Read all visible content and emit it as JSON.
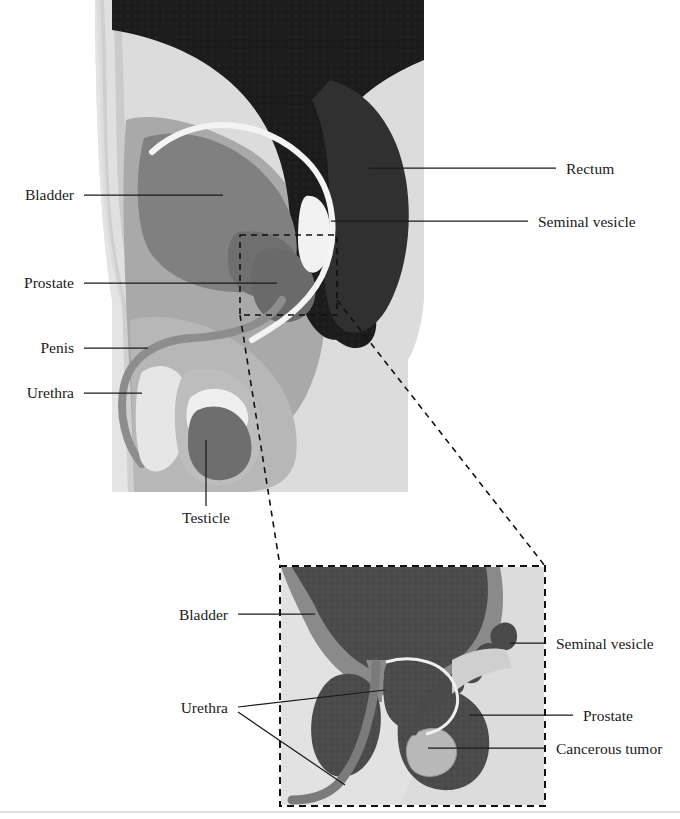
{
  "figure": {
    "main_view_name": "sagittal-male-pelvis",
    "inset_view_name": "prostate-detail-inset"
  },
  "colors": {
    "background": "#ffffff",
    "body_light": "#dcdcdc",
    "body_mid": "#a9a9a9",
    "body_skin": "#c8c8c8",
    "organ_gray": "#808080",
    "organ_dark": "#5e5e5e",
    "rectum_black": "#1c1c1c",
    "highlight_white": "#f2f2f2",
    "tumor_light": "#b5b5b5",
    "leader_line": "#1a1a1a",
    "text": "#1a1a1a",
    "dashed_frame": "#111111",
    "baseline_rule": "#b9b9b9"
  },
  "main_diagram": {
    "labels_left": [
      {
        "id": "bladder",
        "text": "Bladder",
        "x": 74,
        "y": 200,
        "line_x1": 84,
        "line_y1": 195,
        "line_x2": 223,
        "line_y2": 195
      },
      {
        "id": "prostate",
        "text": "Prostate",
        "x": 74,
        "y": 288,
        "line_x1": 84,
        "line_y1": 283,
        "line_x2": 277,
        "line_y2": 283
      },
      {
        "id": "penis",
        "text": "Penis",
        "x": 74,
        "y": 353,
        "line_x1": 84,
        "line_y1": 348,
        "line_x2": 148,
        "line_y2": 348
      },
      {
        "id": "urethra",
        "text": "Urethra",
        "x": 74,
        "y": 398,
        "line_x1": 84,
        "line_y1": 393,
        "line_x2": 142,
        "line_y2": 393
      }
    ],
    "labels_right": [
      {
        "id": "rectum",
        "text": "Rectum",
        "x": 566,
        "y": 174,
        "line_x1": 556,
        "line_y1": 168,
        "line_x2": 369,
        "line_y2": 168
      },
      {
        "id": "seminal-vesicle",
        "text": "Seminal vesicle",
        "x": 538,
        "y": 227,
        "line_x1": 528,
        "line_y1": 221,
        "line_x2": 331,
        "line_y2": 221
      }
    ],
    "labels_bottom": [
      {
        "id": "testicle",
        "text": "Testicle",
        "x": 206,
        "y": 523,
        "line_x1": 206,
        "line_y1": 506,
        "line_x2": 206,
        "line_y2": 440
      }
    ],
    "callout_box": {
      "x": 240,
      "y": 235,
      "width": 97,
      "height": 80
    }
  },
  "inset_diagram": {
    "frame": {
      "x": 280,
      "y": 566,
      "width": 265,
      "height": 240
    },
    "labels_left": [
      {
        "id": "bladder-inset",
        "text": "Bladder",
        "x": 228,
        "y": 620,
        "line_x1": 238,
        "line_y1": 614,
        "line_x2": 315,
        "line_y2": 614
      },
      {
        "id": "urethra-inset",
        "text": "Urethra",
        "x": 228,
        "y": 713
      }
    ],
    "urethra_branches": [
      {
        "from_x": 238,
        "from_y": 707,
        "to_x": 385,
        "to_y": 690
      },
      {
        "from_x": 238,
        "from_y": 712,
        "to_x": 345,
        "to_y": 785
      }
    ],
    "labels_right": [
      {
        "id": "seminal-vesicle-inset",
        "text": "Seminal vesicle",
        "x": 556,
        "y": 649,
        "line_x1": 546,
        "line_y1": 643,
        "line_x2": 510,
        "line_y2": 643
      },
      {
        "id": "prostate-inset",
        "text": "Prostate",
        "x": 583,
        "y": 721,
        "line_x1": 573,
        "line_y1": 715,
        "line_x2": 470,
        "line_y2": 715
      },
      {
        "id": "cancerous-tumor",
        "text": "Cancerous tumor",
        "x": 556,
        "y": 754,
        "line_x1": 546,
        "line_y1": 748,
        "line_x2": 428,
        "line_y2": 748
      }
    ]
  },
  "zoom_connectors": [
    {
      "id": "connector-upper",
      "x1": 337,
      "y1": 300,
      "x2": 545,
      "y2": 566
    },
    {
      "id": "connector-lower",
      "x1": 240,
      "y1": 315,
      "x2": 280,
      "y2": 566
    }
  ],
  "footer_rule": {
    "x1": 0,
    "y1": 812,
    "x2": 680,
    "y2": 812
  }
}
